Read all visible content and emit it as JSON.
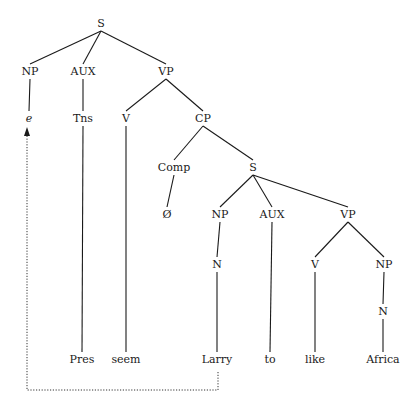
{
  "diagram": {
    "type": "syntax-tree",
    "colors": {
      "ink": "#1a1a1a",
      "trace": "#333333",
      "background": "#ffffff"
    },
    "nodes": [
      {
        "id": "S1",
        "label": "S",
        "x": 101,
        "y": 27
      },
      {
        "id": "NP1",
        "label": "NP",
        "x": 30,
        "y": 75
      },
      {
        "id": "AUX1",
        "label": "AUX",
        "x": 83,
        "y": 75
      },
      {
        "id": "VP1",
        "label": "VP",
        "x": 166,
        "y": 75
      },
      {
        "id": "e",
        "label": "e",
        "x": 29,
        "y": 122,
        "italic": true
      },
      {
        "id": "Tns",
        "label": "Tns",
        "x": 83,
        "y": 122
      },
      {
        "id": "V1",
        "label": "V",
        "x": 126,
        "y": 122
      },
      {
        "id": "CP",
        "label": "CP",
        "x": 203,
        "y": 122
      },
      {
        "id": "Comp",
        "label": "Comp",
        "x": 174,
        "y": 171
      },
      {
        "id": "S2",
        "label": "S",
        "x": 253,
        "y": 171
      },
      {
        "id": "null",
        "label": "Ø",
        "x": 167,
        "y": 218
      },
      {
        "id": "NP2",
        "label": "NP",
        "x": 220,
        "y": 218
      },
      {
        "id": "AUX2",
        "label": "AUX",
        "x": 272,
        "y": 218
      },
      {
        "id": "VP2",
        "label": "VP",
        "x": 348,
        "y": 218
      },
      {
        "id": "N1",
        "label": "N",
        "x": 217,
        "y": 268
      },
      {
        "id": "V2",
        "label": "V",
        "x": 315,
        "y": 268
      },
      {
        "id": "NP3",
        "label": "NP",
        "x": 384,
        "y": 268
      },
      {
        "id": "N2",
        "label": "N",
        "x": 383,
        "y": 315
      },
      {
        "id": "Pres",
        "label": "Pres",
        "x": 82,
        "y": 363
      },
      {
        "id": "seem",
        "label": "seem",
        "x": 126,
        "y": 363
      },
      {
        "id": "Larry",
        "label": "Larry",
        "x": 217,
        "y": 363
      },
      {
        "id": "to",
        "label": "to",
        "x": 270,
        "y": 363
      },
      {
        "id": "like",
        "label": "like",
        "x": 315,
        "y": 363
      },
      {
        "id": "Africa",
        "label": "Africa",
        "x": 383,
        "y": 363
      }
    ],
    "edges": [
      [
        "S1",
        "NP1"
      ],
      [
        "S1",
        "AUX1"
      ],
      [
        "S1",
        "VP1"
      ],
      [
        "NP1",
        "e"
      ],
      [
        "AUX1",
        "Tns"
      ],
      [
        "Tns",
        "Pres"
      ],
      [
        "VP1",
        "V1"
      ],
      [
        "VP1",
        "CP"
      ],
      [
        "V1",
        "seem"
      ],
      [
        "CP",
        "Comp"
      ],
      [
        "CP",
        "S2"
      ],
      [
        "Comp",
        "null"
      ],
      [
        "S2",
        "NP2"
      ],
      [
        "S2",
        "AUX2"
      ],
      [
        "S2",
        "VP2"
      ],
      [
        "NP2",
        "N1"
      ],
      [
        "N1",
        "Larry"
      ],
      [
        "AUX2",
        "to"
      ],
      [
        "VP2",
        "V2"
      ],
      [
        "VP2",
        "NP3"
      ],
      [
        "V2",
        "like"
      ],
      [
        "NP3",
        "N2"
      ],
      [
        "N2",
        "Africa"
      ]
    ],
    "movement": {
      "from": "Larry",
      "to": "e",
      "style": "dotted-arrow",
      "path": [
        [
          218,
          372
        ],
        [
          218,
          390
        ],
        [
          27,
          390
        ],
        [
          27,
          135
        ]
      ]
    }
  }
}
